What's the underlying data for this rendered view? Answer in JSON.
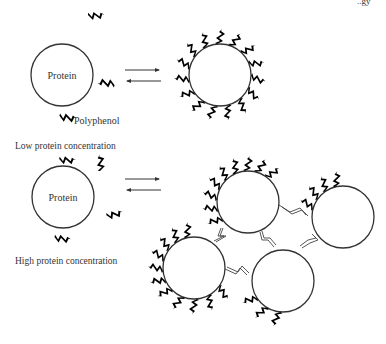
{
  "diagram": {
    "header_fragment": "..gy",
    "panels": [
      {
        "id": "low",
        "caption": "Low protein concentration",
        "free_protein_label": "Protein",
        "legend_label": "Polyphenol",
        "equilibrium": "reversible",
        "complex": "single protein coated by polyphenols"
      },
      {
        "id": "high",
        "caption": "High protein concentration",
        "free_protein_label": "Protein",
        "equilibrium": "reversible",
        "complex": "four proteins cross-linked by polyphenol bridges"
      }
    ]
  },
  "colors": {
    "ink": "#000000",
    "line": "#333333",
    "background": "#ffffff"
  }
}
